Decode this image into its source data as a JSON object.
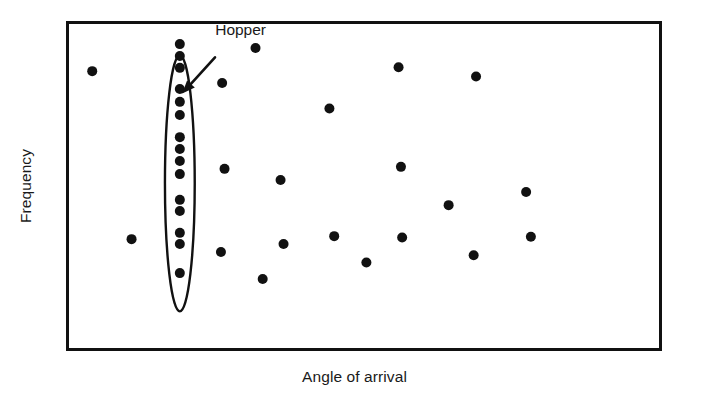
{
  "chart_data": {
    "type": "scatter",
    "title": "",
    "xlabel": "Angle of arrival",
    "ylabel": "Frequency",
    "xlim": [
      0,
      100
    ],
    "ylim": [
      0,
      100
    ],
    "grid": false,
    "legend": null,
    "axis_ticks": {
      "x": [],
      "y": []
    },
    "annotations": [
      {
        "name": "hopper-callout",
        "text": "Hopper",
        "label_x": 25.2,
        "label_y": 94.0,
        "arrow_from_x": 25.0,
        "arrow_from_y": 89.0,
        "arrow_to_x": 19.5,
        "arrow_to_y": 78.0
      }
    ],
    "highlight_region": {
      "name": "hopper-ellipse",
      "shape": "ellipse",
      "center_x": 19.1,
      "center_y": 50.8,
      "radius_x": 2.5,
      "radius_y": 38.8,
      "label": "Hopper"
    },
    "series": [
      {
        "name": "Hopper (frequency-hopping emitter)",
        "marker": "circle",
        "color": "#111111",
        "points": [
          {
            "x": 19.1,
            "y": 93.0
          },
          {
            "x": 19.1,
            "y": 89.4
          },
          {
            "x": 19.1,
            "y": 85.8
          },
          {
            "x": 19.1,
            "y": 79.4
          },
          {
            "x": 19.1,
            "y": 75.5
          },
          {
            "x": 19.1,
            "y": 71.5
          },
          {
            "x": 19.1,
            "y": 64.8
          },
          {
            "x": 19.1,
            "y": 61.2
          },
          {
            "x": 19.1,
            "y": 57.6
          },
          {
            "x": 19.1,
            "y": 53.6
          },
          {
            "x": 19.1,
            "y": 45.8
          },
          {
            "x": 19.1,
            "y": 42.4
          },
          {
            "x": 19.1,
            "y": 35.8
          },
          {
            "x": 19.1,
            "y": 32.4
          },
          {
            "x": 19.1,
            "y": 23.6
          }
        ]
      },
      {
        "name": "Background emitters",
        "marker": "circle",
        "color": "#111111",
        "points": [
          {
            "x": 4.4,
            "y": 84.8
          },
          {
            "x": 11.0,
            "y": 33.9
          },
          {
            "x": 26.2,
            "y": 81.2
          },
          {
            "x": 26.6,
            "y": 55.2
          },
          {
            "x": 26.0,
            "y": 30.0
          },
          {
            "x": 31.8,
            "y": 91.8
          },
          {
            "x": 33.0,
            "y": 21.8
          },
          {
            "x": 36.0,
            "y": 51.8
          },
          {
            "x": 36.5,
            "y": 32.4
          },
          {
            "x": 44.2,
            "y": 73.5
          },
          {
            "x": 45.0,
            "y": 34.8
          },
          {
            "x": 50.4,
            "y": 26.8
          },
          {
            "x": 55.8,
            "y": 86.0
          },
          {
            "x": 56.2,
            "y": 55.8
          },
          {
            "x": 56.4,
            "y": 34.4
          },
          {
            "x": 64.2,
            "y": 44.2
          },
          {
            "x": 68.8,
            "y": 83.2
          },
          {
            "x": 68.4,
            "y": 29.0
          },
          {
            "x": 77.2,
            "y": 48.2
          },
          {
            "x": 78.0,
            "y": 34.6
          }
        ]
      }
    ]
  },
  "plot_frame": {
    "left_px": 66,
    "top_px": 21,
    "right_px": 662,
    "bottom_px": 351,
    "border_color": "#111111",
    "border_width_px": 3,
    "background": "#ffffff"
  },
  "style": {
    "marker_radius_px": 5,
    "marker_color": "#111111",
    "ellipse_stroke": "#111111",
    "ellipse_stroke_width_px": 2.4,
    "arrow_color": "#111111",
    "text_color": "#1a1a1a"
  }
}
